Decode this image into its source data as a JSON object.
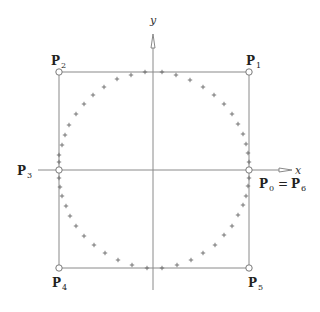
{
  "figure": {
    "type": "diagram",
    "axes": {
      "x_label": "x",
      "y_label": "y"
    },
    "control_points": [
      {
        "id": "P0",
        "label": "P",
        "sub": "0",
        "x": 249,
        "y": 170,
        "display": "P0 = P6"
      },
      {
        "id": "P1",
        "label": "P",
        "sub": "1",
        "x": 249,
        "y": 72
      },
      {
        "id": "P2",
        "label": "P",
        "sub": "2",
        "x": 59,
        "y": 72
      },
      {
        "id": "P3",
        "label": "P",
        "sub": "3",
        "x": 59,
        "y": 170
      },
      {
        "id": "P4",
        "label": "P",
        "sub": "4",
        "x": 59,
        "y": 268
      },
      {
        "id": "P5",
        "label": "P",
        "sub": "5",
        "x": 249,
        "y": 268
      }
    ],
    "labels": {
      "p0_main": "P",
      "p0_sub": "0",
      "p0_eq": "=",
      "p6_main": "P",
      "p6_sub": "6",
      "p1_main": "P",
      "p1_sub": "1",
      "p2_main": "P",
      "p2_sub": "2",
      "p3_main": "P",
      "p3_sub": "3",
      "p4_main": "P",
      "p4_sub": "4",
      "p5_main": "P",
      "p5_sub": "5"
    },
    "curve_points": [
      [
        249,
        162
      ],
      [
        248,
        153
      ],
      [
        246,
        144
      ],
      [
        243,
        134
      ],
      [
        238,
        124
      ],
      [
        232,
        114
      ],
      [
        224,
        104
      ],
      [
        214,
        95
      ],
      [
        203,
        87
      ],
      [
        190,
        80
      ],
      [
        176,
        75
      ],
      [
        162,
        72
      ],
      [
        145,
        72
      ],
      [
        131,
        75
      ],
      [
        117,
        79
      ],
      [
        104,
        87
      ],
      [
        93,
        95
      ],
      [
        84,
        104
      ],
      [
        76,
        114
      ],
      [
        69,
        125
      ],
      [
        65,
        135
      ],
      [
        62,
        145
      ],
      [
        59,
        155
      ],
      [
        59,
        162
      ],
      [
        59,
        178
      ],
      [
        60,
        187
      ],
      [
        62,
        196
      ],
      [
        66,
        206
      ],
      [
        70,
        216
      ],
      [
        76,
        226
      ],
      [
        84,
        236
      ],
      [
        94,
        245
      ],
      [
        105,
        253
      ],
      [
        118,
        260
      ],
      [
        132,
        265
      ],
      [
        147,
        268
      ],
      [
        162,
        268
      ],
      [
        177,
        265
      ],
      [
        191,
        260
      ],
      [
        203,
        253
      ],
      [
        215,
        245
      ],
      [
        224,
        235
      ],
      [
        232,
        226
      ],
      [
        238,
        215
      ],
      [
        243,
        205
      ],
      [
        246,
        196
      ],
      [
        248,
        186
      ],
      [
        249,
        178
      ]
    ],
    "colors": {
      "lines": "#8a8a8a",
      "markers": "#6a6a6a",
      "text": "#222222"
    }
  }
}
